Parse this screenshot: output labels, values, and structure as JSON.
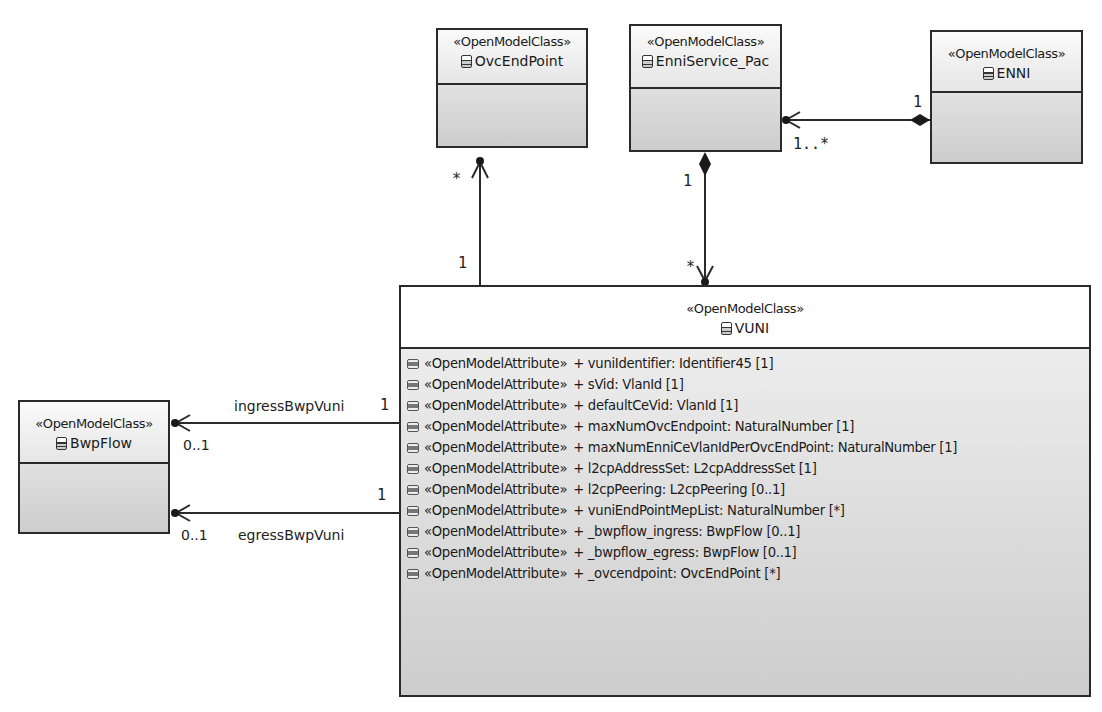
{
  "diagram": {
    "type": "UML class diagram",
    "classes": {
      "ovcendpoint": {
        "stereotype": "«OpenModelClass»",
        "name": "OvcEndPoint"
      },
      "enniservice": {
        "stereotype": "«OpenModelClass»",
        "name": "EnniService_Pac"
      },
      "enni": {
        "stereotype": "«OpenModelClass»",
        "name": "ENNI"
      },
      "bwpflow": {
        "stereotype": "«OpenModelClass»",
        "name": "BwpFlow"
      },
      "vuni": {
        "stereotype": "«OpenModelClass»",
        "name": "VUNI",
        "attributes": [
          {
            "stereotype": "«OpenModelAttribute»",
            "text": "+ vuniIdentifier: Identifier45 [1]"
          },
          {
            "stereotype": "«OpenModelAttribute»",
            "text": "+ sVid: VlanId [1]"
          },
          {
            "stereotype": "«OpenModelAttribute»",
            "text": "+ defaultCeVid: VlanId [1]"
          },
          {
            "stereotype": "«OpenModelAttribute»",
            "text": "+ maxNumOvcEndpoint: NaturalNumber [1]"
          },
          {
            "stereotype": "«OpenModelAttribute»",
            "text": "+ maxNumEnniCeVlanIdPerOvcEndPoint: NaturalNumber [1]"
          },
          {
            "stereotype": "«OpenModelAttribute»",
            "text": "+ l2cpAddressSet: L2cpAddressSet [1]"
          },
          {
            "stereotype": "«OpenModelAttribute»",
            "text": "+ l2cpPeering: L2cpPeering [0..1]"
          },
          {
            "stereotype": "«OpenModelAttribute»",
            "text": "+ vuniEndPointMepList: NaturalNumber [*]"
          },
          {
            "stereotype": "«OpenModelAttribute»",
            "text": "+ _bwpflow_ingress: BwpFlow [0..1]"
          },
          {
            "stereotype": "«OpenModelAttribute»",
            "text": "+ _bwpflow_egress: BwpFlow [0..1]"
          },
          {
            "stereotype": "«OpenModelAttribute»",
            "text": "+ _ovcendpoint: OvcEndPoint [*]"
          }
        ]
      }
    },
    "associations": {
      "vuni_ovc": {
        "source_mult": "1",
        "target_mult": "*"
      },
      "enni_enniservice": {
        "source_mult": "1",
        "target_mult": "1..*"
      },
      "enniservice_vuni": {
        "source_mult": "1",
        "target_mult": "*"
      },
      "ingress": {
        "role": "ingressBwpVuni",
        "source_mult": "1",
        "target_mult": "0..1"
      },
      "egress": {
        "role": "egressBwpVuni",
        "source_mult": "1",
        "target_mult": "0..1"
      }
    },
    "colors": {
      "line": "#2a2a2a",
      "box_top": "#f2f2f2",
      "box_bottom": "#cdcdcd"
    }
  }
}
